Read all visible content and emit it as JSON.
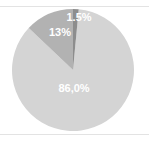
{
  "chart_data": {
    "type": "pie",
    "title": "",
    "subtitle": "",
    "xlabel": "",
    "ylabel": "",
    "grid": false,
    "legend_position": "none",
    "categories": [
      "1.5%",
      "13%",
      "86,0%"
    ],
    "values": [
      1.5,
      13,
      86.0
    ],
    "labels": [
      "1.5%",
      "13%",
      "86,0%"
    ],
    "slices": [
      {
        "label": "1.5%",
        "value": 1.5,
        "color": "#8d8d8d",
        "label_color": "#ffffff",
        "position": "top"
      },
      {
        "label": "13%",
        "value": 13,
        "color": "#b2b2b2",
        "label_color": "#ffffff",
        "position": "upper-left"
      },
      {
        "label": "86,0%",
        "value": 86.0,
        "color": "#d4d4d4",
        "label_color": "#ffffff",
        "position": "center"
      }
    ],
    "start_angle_deg": 0,
    "direction": "clockwise",
    "annotations": []
  },
  "figure": {
    "background_color": "#ffffff",
    "rule_color": "#e3e3e3",
    "center_x": 73,
    "center_y": 70,
    "radius": 61
  }
}
